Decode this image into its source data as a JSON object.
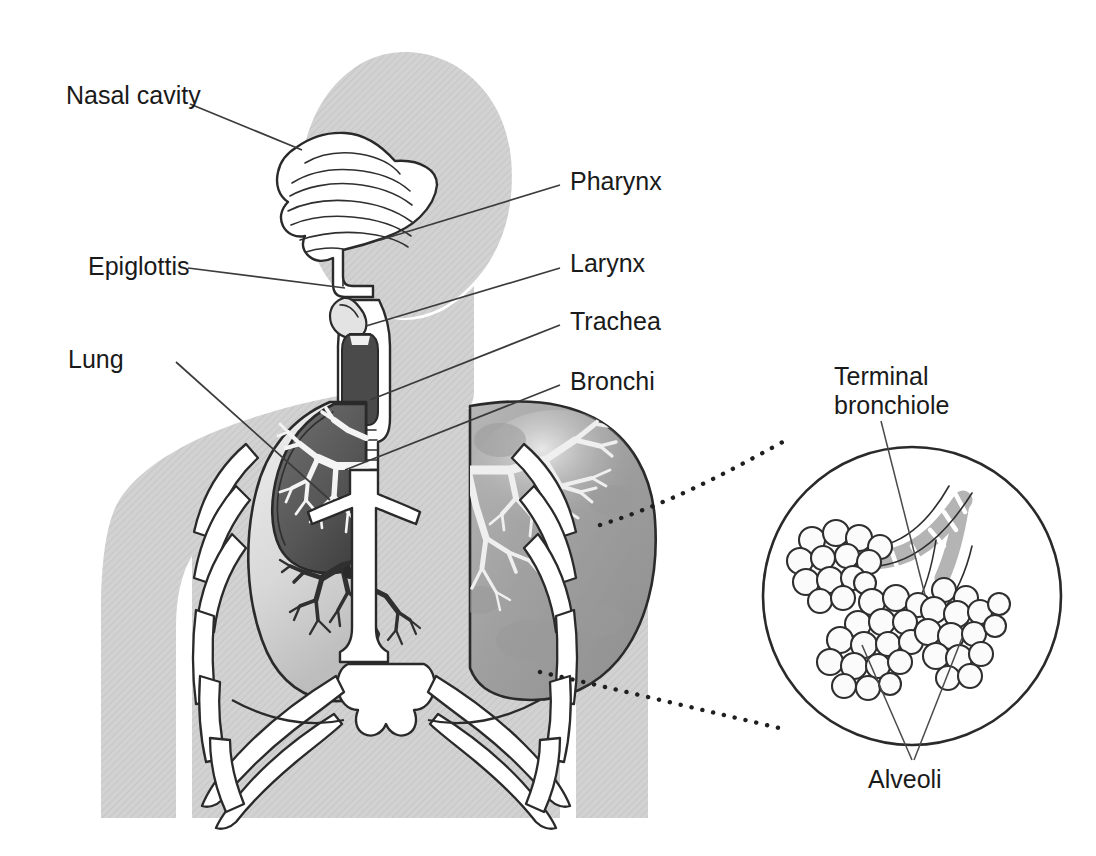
{
  "figure": {
    "background_color": "#ffffff",
    "body_silhouette_color": "#d2d2d2",
    "ink_color": "#2a2a2a",
    "label_color": "#1a1a1a"
  },
  "labels": {
    "nasal_cavity": "Nasal cavity",
    "pharynx": "Pharynx",
    "epiglottis": "Epiglottis",
    "larynx": "Larynx",
    "trachea": "Trachea",
    "lung": "Lung",
    "bronchi": "Bronchi",
    "terminal_bronchiole_line1": "Terminal",
    "terminal_bronchiole_line2": "bronchiole",
    "alveoli": "Alveoli"
  },
  "structures": {
    "head_silhouette": "head-silhouette",
    "torso_silhouette": "torso-silhouette",
    "nasal_cavity_shape": "nasal-cavity",
    "pharynx_shape": "pharynx-passage",
    "epiglottis_shape": "epiglottis",
    "larynx_shape": "larynx",
    "trachea_shape": "trachea",
    "left_lung_shape": "left-lung-cutaway",
    "right_lung_shape": "right-lung-shaded",
    "bronchial_tree_left": "bronchial-tree-left",
    "bronchial_tree_right": "bronchial-tree-right",
    "ribcage_shape": "ribcage",
    "sternum_shape": "sternum",
    "diaphragm_shape": "diaphragm",
    "inset_circle": "magnified-inset-circle",
    "bronchiole_tube": "terminal-bronchiole-tube",
    "alveoli_clusters": "alveoli-clusters"
  },
  "connectors": {
    "inset_upper_dotted": "inset-connector-upper",
    "inset_lower_dotted": "inset-connector-lower"
  }
}
